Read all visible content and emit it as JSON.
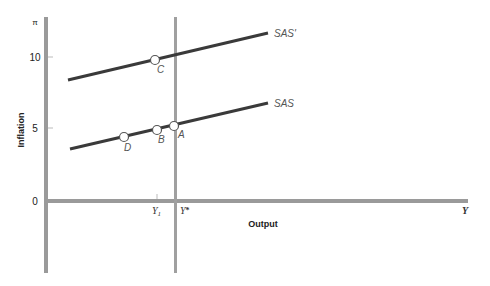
{
  "diagram": {
    "type": "macroeconomic-sas-diagram",
    "y_axis": {
      "symbol": "π",
      "title": "Inflation",
      "ticks": [
        {
          "label": "10",
          "value": 10
        },
        {
          "label": "5",
          "value": 5
        },
        {
          "label": "0",
          "value": 0
        }
      ]
    },
    "x_axis": {
      "symbol": "Y",
      "title": "Output",
      "markers": [
        {
          "label": "Y1",
          "base": "Y",
          "sub": "1"
        },
        {
          "label": "Y*",
          "base": "Y",
          "sup": "*"
        }
      ]
    },
    "curves": [
      {
        "name": "SAS'",
        "label": "SAS'"
      },
      {
        "name": "SAS",
        "label": "SAS"
      }
    ],
    "points": [
      {
        "name": "C",
        "label": "C",
        "curve": "SAS'"
      },
      {
        "name": "A",
        "label": "A",
        "curve": "SAS"
      },
      {
        "name": "B",
        "label": "B",
        "curve": "SAS"
      },
      {
        "name": "D",
        "label": "D",
        "curve": "SAS"
      }
    ],
    "colors": {
      "axis": "#9a9a9a",
      "curve": "#3a3a3a",
      "point_fill": "#ffffff",
      "point_stroke": "#555555",
      "label": "#555555"
    }
  }
}
